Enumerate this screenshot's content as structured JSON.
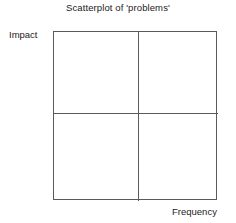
{
  "figure": {
    "title": "Scatterplot of 'problems'",
    "y_axis_label": "Impact",
    "x_axis_label": "Frequency"
  },
  "annotations": {
    "priority": {
      "line1": "Priority for",
      "line2": "development"
    }
  },
  "colors": {
    "frame_line": "#5a5a5a",
    "divider_line": "#5a5a5a",
    "text": "#1a1a1a",
    "background": "#ffffff"
  },
  "chart_data": {
    "type": "scatter",
    "title": "Scatterplot of 'problems'",
    "xlabel": "Frequency",
    "ylabel": "Impact",
    "grid": false,
    "legend": null,
    "series": [
      {
        "name": "problems",
        "x": [],
        "y": []
      }
    ],
    "xlim": [
      0,
      1
    ],
    "ylim": [
      0,
      1
    ],
    "xticks": [],
    "yticks": [],
    "xticklabels": [],
    "yticklabels": [],
    "quadrant_dividers": {
      "vertical_x": 0.52,
      "horizontal_y": 0.48
    },
    "quadrants": [
      {
        "position": "top-left",
        "label": ""
      },
      {
        "position": "top-right",
        "label": "Priority for development"
      },
      {
        "position": "bottom-left",
        "label": ""
      },
      {
        "position": "bottom-right",
        "label": ""
      }
    ],
    "annotations": [
      {
        "text": "Priority for development",
        "quadrant": "top-right",
        "style": "italic",
        "x": 0.76,
        "y": 0.79
      }
    ]
  }
}
